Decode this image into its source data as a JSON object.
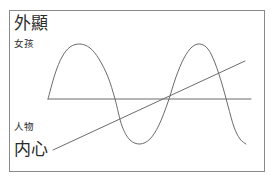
{
  "diagram": {
    "title": "",
    "frame": {
      "border_color": "#8a8a8a",
      "background": "#ffffff"
    },
    "labels": {
      "top_axis_label": "外顯",
      "top_series_label": "女孩",
      "bottom_series_label": "人物",
      "bottom_axis_label": "内心"
    },
    "stroke_color": "#6b6b6b"
  },
  "chart_data": {
    "type": "line",
    "title": "",
    "xlabel": "",
    "ylabel": "",
    "grid": false,
    "legend_position": "none",
    "axis_top_label": "外顯",
    "axis_bottom_label": "内心",
    "xlim": [
      0,
      256
    ],
    "ylim": [
      0,
      162
    ],
    "series": [
      {
        "name": "女孩",
        "type": "sine-wave",
        "description": "oscillating wave, two full cycles, peaks near top of frame and troughs near bottom",
        "points": [
          [
            48,
            99
          ],
          [
            55,
            74
          ],
          [
            62,
            57
          ],
          [
            70,
            47
          ],
          [
            80,
            44
          ],
          [
            90,
            48
          ],
          [
            99,
            59
          ],
          [
            108,
            77
          ],
          [
            115,
            99
          ],
          [
            122,
            126
          ],
          [
            130,
            140
          ],
          [
            140,
            144
          ],
          [
            150,
            139
          ],
          [
            159,
            125
          ],
          [
            168,
            102
          ],
          [
            176,
            77
          ],
          [
            184,
            58
          ],
          [
            192,
            47
          ],
          [
            200,
            44
          ],
          [
            208,
            49
          ],
          [
            215,
            63
          ],
          [
            222,
            84
          ],
          [
            228,
            106
          ],
          [
            234,
            127
          ],
          [
            240,
            139
          ],
          [
            246,
            144
          ]
        ],
        "peaks": [
          [
            80,
            44
          ],
          [
            200,
            44
          ]
        ],
        "troughs": [
          [
            132,
            144
          ],
          [
            246,
            144
          ]
        ]
      },
      {
        "name": "人物",
        "type": "diagonal-line",
        "description": "straight line rising from lower-left to upper-right",
        "points": [
          [
            53,
            150
          ],
          [
            245,
            61
          ]
        ]
      },
      {
        "name": "baseline",
        "type": "horizontal-line",
        "description": "horizontal reference line across the middle of the frame",
        "points": [
          [
            48,
            99
          ],
          [
            251,
            99
          ]
        ]
      }
    ]
  }
}
